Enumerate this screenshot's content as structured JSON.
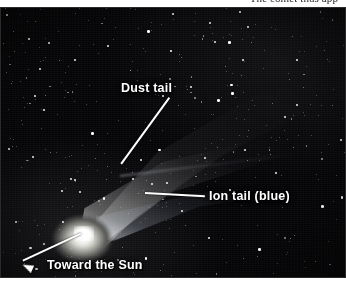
{
  "page": {
    "background_color": "#ffffff",
    "body_text_above_figure": "The comet thus app"
  },
  "figure": {
    "name": "comet-photograph",
    "subject": "comet",
    "image_type": "astrophotograph",
    "palette": {
      "sky": "#050507",
      "star": "#ffffff",
      "coma": "#ffffff",
      "label_text": "#ffffff",
      "leader_line": "#ffffff"
    },
    "annotations": [
      {
        "id": "dust-tail",
        "label": "Dust tail",
        "leader": "diagonal-line-down-left",
        "points_to": "broad fan-shaped tail"
      },
      {
        "id": "ion-tail",
        "label": "Ion tail (blue)",
        "leader": "horizontal-line-left",
        "points_to": "narrow straight tail"
      },
      {
        "id": "toward-the-sun",
        "label": "Toward the Sun",
        "leader": "arrow-down-left",
        "points_to": "direction of the Sun"
      }
    ],
    "features": {
      "coma_label": "coma",
      "nucleus_label": "nucleus"
    }
  }
}
